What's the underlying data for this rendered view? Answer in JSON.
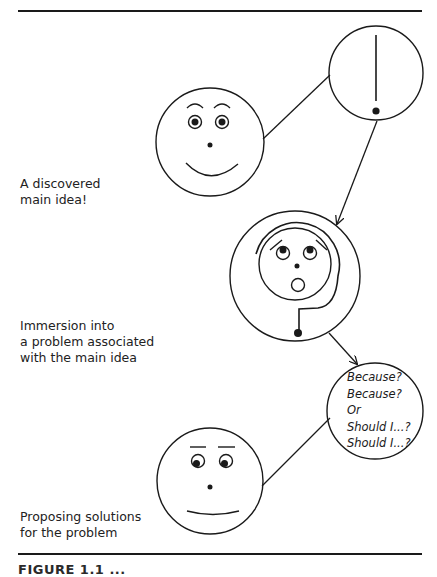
{
  "figure": {
    "caption_truncated": "FIGURE 1.1 ...",
    "stages": [
      {
        "id": "discovered-main-idea",
        "label_lines": [
          "A discovered",
          "main idea!"
        ],
        "face_expression": "smiling, eyes wide open",
        "thought_bubble": "exclamation mark"
      },
      {
        "id": "immersion",
        "label_lines": [
          "Immersion into",
          "a problem associated",
          "with the main idea"
        ],
        "face_expression": "surprised, open O mouth, raised eyes",
        "thought_bubble": "question mark wrapping around face"
      },
      {
        "id": "proposing-solutions",
        "label_lines": [
          "Proposing solutions",
          "for the problem"
        ],
        "face_expression": "thoughtful, flat brows, eyes looking aside",
        "thought_bubble_lines": [
          "Because?",
          "Because?",
          "Or",
          "Should I...?",
          "Should I...?"
        ]
      }
    ],
    "colors": {
      "ink": "#1a1a1a",
      "background": "#ffffff"
    }
  }
}
